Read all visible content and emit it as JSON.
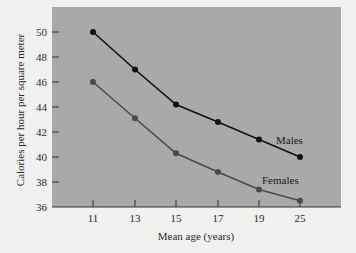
{
  "chart_data": {
    "type": "line",
    "title": "",
    "xlabel": "Mean age (years)",
    "ylabel": "Calories per hour per square meter",
    "categories": [
      "11",
      "13",
      "15",
      "17",
      "19",
      "25"
    ],
    "series": [
      {
        "name": "Males",
        "values": [
          50.0,
          47.0,
          44.2,
          42.8,
          41.4,
          40.0
        ],
        "color": "#111111"
      },
      {
        "name": "Females",
        "values": [
          46.0,
          43.1,
          40.3,
          38.8,
          37.4,
          36.5
        ],
        "color": "#4a4a4a"
      }
    ],
    "ylim": [
      36,
      52
    ],
    "yticks": [
      36,
      38,
      40,
      42,
      44,
      46,
      48,
      50
    ],
    "grid": false,
    "legend": "inline labels",
    "plot_background": "#a9a9a9",
    "page_background": "#f1f1f0"
  }
}
